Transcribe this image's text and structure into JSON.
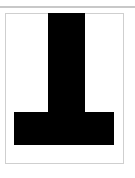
{
  "figure": {
    "shape": "inverted-t-glyph",
    "colors": {
      "fill": "#000000",
      "background": "#ffffff",
      "frame_border": "#cfcfcf",
      "top_rule": "#c8c8c8"
    }
  }
}
